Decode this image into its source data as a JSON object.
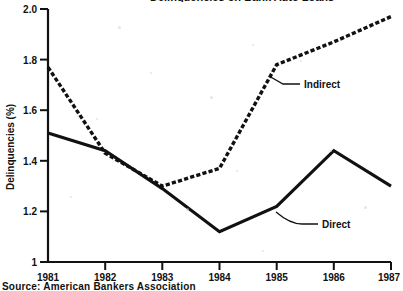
{
  "figure": {
    "top_title_partial": "Delinquencies on Bank Auto Loans",
    "source_note_partial": "Source: American Bankers Association"
  },
  "chart_data": {
    "type": "line",
    "title": "",
    "xlabel": "",
    "ylabel": "Delinquencies (%)",
    "x": [
      "1981",
      "1982",
      "1983",
      "1984",
      "1985",
      "1986",
      "1987"
    ],
    "xlim": [
      "1981",
      "1987"
    ],
    "ylim": [
      1.0,
      2.0
    ],
    "yticks": [
      "1",
      "1.2",
      "1.4",
      "1.6",
      "1.8",
      "2.0"
    ],
    "ytick_values": [
      1.0,
      1.2,
      1.4,
      1.6,
      1.8,
      2.0
    ],
    "grid": false,
    "legend": "inline-annotations",
    "series": [
      {
        "name": "Indirect",
        "style": "dashed",
        "values": [
          1.77,
          1.43,
          1.3,
          1.37,
          1.78,
          1.87,
          1.97
        ]
      },
      {
        "name": "Direct",
        "style": "solid",
        "values": [
          1.51,
          1.44,
          1.29,
          1.12,
          1.22,
          1.44,
          1.3
        ]
      }
    ],
    "annotations": [
      {
        "label": "Indirect",
        "x": "1985",
        "y": 1.7
      },
      {
        "label": "Direct",
        "x": "1985",
        "y": 1.15
      }
    ]
  },
  "axis": {
    "y_title": "Delinquencies (%)",
    "y_tick_labels": [
      "2.0",
      "1.8",
      "1.6",
      "1.4",
      "1.2",
      "1"
    ],
    "x_tick_labels": [
      "1981",
      "1982",
      "1983",
      "1984",
      "1985",
      "1986",
      "1987"
    ]
  }
}
